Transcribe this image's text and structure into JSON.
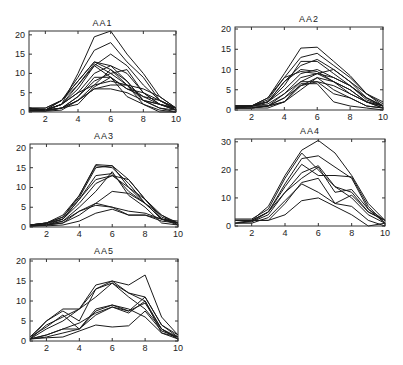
{
  "chart_data": [
    {
      "type": "line",
      "title": "AA1",
      "xlabel": "",
      "ylabel": "",
      "xlim": [
        1,
        10
      ],
      "ylim": [
        0,
        21
      ],
      "xticks": [
        2,
        4,
        6,
        8,
        10
      ],
      "yticks": [
        0,
        5,
        10,
        15,
        20
      ],
      "x": [
        1,
        2,
        3,
        4,
        5,
        6,
        7,
        8,
        9,
        10
      ],
      "series": [
        {
          "name": "s1",
          "values": [
            1,
            0.5,
            2,
            10,
            19.5,
            21,
            15,
            10,
            4,
            1
          ]
        },
        {
          "name": "s2",
          "values": [
            1,
            0.5,
            3,
            9,
            16,
            18,
            13,
            9,
            3,
            0.5
          ]
        },
        {
          "name": "s3",
          "values": [
            0.5,
            0.3,
            2,
            7,
            12,
            15,
            12,
            7,
            3,
            1
          ]
        },
        {
          "name": "s4",
          "values": [
            1,
            1,
            3,
            8,
            13,
            12,
            10,
            5,
            2,
            0.5
          ]
        },
        {
          "name": "s5",
          "values": [
            0.5,
            0.5,
            3,
            8,
            13,
            11,
            8,
            3,
            2,
            1
          ]
        },
        {
          "name": "s6",
          "values": [
            1,
            1,
            3,
            7,
            12.5,
            10,
            7,
            4,
            2,
            0.5
          ]
        },
        {
          "name": "s7",
          "values": [
            0.5,
            0.5,
            2,
            6,
            12,
            9,
            6,
            4,
            3,
            1
          ]
        },
        {
          "name": "s8",
          "values": [
            0.3,
            0.5,
            2,
            5,
            10,
            12,
            8,
            3,
            1,
            0
          ]
        },
        {
          "name": "s9",
          "values": [
            0.5,
            0.5,
            1,
            4,
            8,
            10,
            11,
            5,
            2,
            1
          ]
        },
        {
          "name": "s10",
          "values": [
            0.3,
            0.3,
            1,
            3,
            7,
            11,
            7,
            2,
            0,
            0
          ]
        },
        {
          "name": "s11",
          "values": [
            0.5,
            0.5,
            1,
            4,
            9,
            9,
            6,
            5,
            3,
            1
          ]
        },
        {
          "name": "s12",
          "values": [
            1,
            0.5,
            2,
            5,
            7,
            8,
            7,
            6,
            4,
            1
          ]
        },
        {
          "name": "s13",
          "values": [
            0.2,
            0.2,
            0.5,
            3,
            6,
            7,
            7,
            3,
            1,
            0.5
          ]
        },
        {
          "name": "s14",
          "values": [
            0.5,
            0.5,
            1,
            3,
            6,
            6,
            5,
            3,
            2,
            0.5
          ]
        },
        {
          "name": "s15",
          "values": [
            0.3,
            0.3,
            1,
            2,
            6.5,
            9,
            4,
            2,
            0.5,
            0
          ]
        }
      ]
    },
    {
      "type": "line",
      "title": "AA2",
      "xlabel": "",
      "ylabel": "",
      "xlim": [
        1,
        10
      ],
      "ylim": [
        0,
        20.5
      ],
      "xticks": [
        2,
        4,
        6,
        8,
        10
      ],
      "yticks": [
        0,
        5,
        10,
        15,
        20
      ],
      "x": [
        1,
        2,
        3,
        4,
        5,
        6,
        7,
        8,
        9,
        10
      ],
      "series": [
        {
          "name": "s1",
          "values": [
            1,
            1,
            3,
            9,
            15.3,
            15.5,
            12,
            8.5,
            4,
            1.5
          ]
        },
        {
          "name": "s2",
          "values": [
            1,
            1,
            2.5,
            8,
            13,
            14,
            11,
            8,
            4,
            1
          ]
        },
        {
          "name": "s3",
          "values": [
            1,
            1,
            2,
            7,
            11,
            12.5,
            10,
            7,
            3,
            1
          ]
        },
        {
          "name": "s4",
          "values": [
            0.5,
            1,
            2,
            6,
            12,
            12,
            9,
            6,
            2.5,
            1
          ]
        },
        {
          "name": "s5",
          "values": [
            0.5,
            1,
            2,
            7,
            10,
            9.5,
            7,
            4,
            2,
            0.5
          ]
        },
        {
          "name": "s6",
          "values": [
            1,
            1,
            3,
            8,
            9.5,
            9,
            7,
            5,
            2,
            1
          ]
        },
        {
          "name": "s7",
          "values": [
            0.5,
            1,
            2,
            5,
            9,
            10,
            8,
            6,
            3,
            1
          ]
        },
        {
          "name": "s8",
          "values": [
            0.5,
            0.5,
            1,
            4,
            8,
            9,
            10,
            7,
            4,
            2
          ]
        },
        {
          "name": "s9",
          "values": [
            1,
            1,
            1.5,
            4,
            7,
            9,
            8,
            6,
            3,
            1
          ]
        },
        {
          "name": "s10",
          "values": [
            0.5,
            0.5,
            1,
            3,
            6,
            8,
            7,
            5,
            2,
            0.5
          ]
        },
        {
          "name": "s11",
          "values": [
            0.5,
            0.5,
            1,
            2,
            6,
            7,
            6,
            4,
            2,
            1
          ]
        },
        {
          "name": "s12",
          "values": [
            0.5,
            1,
            1,
            3,
            7,
            7,
            4,
            3,
            1,
            0.5
          ]
        },
        {
          "name": "s13",
          "values": [
            1,
            1,
            1,
            2,
            5,
            8,
            5,
            3,
            1,
            0.5
          ]
        },
        {
          "name": "s14",
          "values": [
            0.5,
            0.5,
            0.5,
            2,
            6.5,
            6.5,
            2,
            1,
            0.5,
            0
          ]
        }
      ]
    },
    {
      "type": "line",
      "title": "AA3",
      "xlabel": "",
      "ylabel": "",
      "xlim": [
        1,
        10
      ],
      "ylim": [
        0,
        21
      ],
      "xticks": [
        2,
        4,
        6,
        8,
        10
      ],
      "yticks": [
        0,
        5,
        10,
        15,
        20
      ],
      "x": [
        1,
        2,
        3,
        4,
        5,
        6,
        7,
        8,
        9,
        10
      ],
      "series": [
        {
          "name": "s1",
          "values": [
            0.5,
            1,
            3,
            8,
            15.8,
            15.5,
            12,
            7,
            2,
            1
          ]
        },
        {
          "name": "s2",
          "values": [
            0.5,
            1,
            2.5,
            8,
            15.5,
            15,
            11,
            6,
            2,
            0.5
          ]
        },
        {
          "name": "s3",
          "values": [
            0.5,
            1,
            2.5,
            7.5,
            15,
            15.5,
            10,
            6,
            2,
            1
          ]
        },
        {
          "name": "s4",
          "values": [
            0.3,
            0.8,
            2,
            7,
            13,
            13.5,
            9,
            6,
            2,
            1
          ]
        },
        {
          "name": "s5",
          "values": [
            0.5,
            1,
            2,
            7,
            12,
            13,
            12,
            7,
            2.5,
            1
          ]
        },
        {
          "name": "s6",
          "values": [
            0.3,
            0.5,
            2,
            6,
            11,
            13,
            10,
            7,
            3,
            1
          ]
        },
        {
          "name": "s7",
          "values": [
            0.2,
            0.5,
            1.5,
            5,
            9,
            14,
            8,
            5,
            1,
            0.5
          ]
        },
        {
          "name": "s8",
          "values": [
            0.3,
            0.5,
            1,
            3,
            6,
            9,
            8.5,
            6,
            3,
            0.5
          ]
        },
        {
          "name": "s9",
          "values": [
            0.5,
            0.5,
            1,
            4,
            6,
            5,
            3,
            3,
            2,
            1
          ]
        },
        {
          "name": "s10",
          "values": [
            0.3,
            0.5,
            1.5,
            4,
            5.5,
            5,
            4,
            3.5,
            2,
            1.5
          ]
        },
        {
          "name": "s11",
          "values": [
            0.2,
            0.3,
            0.5,
            1.5,
            3.5,
            4.5,
            3,
            3,
            1.5,
            1
          ]
        }
      ]
    },
    {
      "type": "line",
      "title": "AA4",
      "xlabel": "",
      "ylabel": "",
      "xlim": [
        1,
        10
      ],
      "ylim": [
        0,
        31
      ],
      "xticks": [
        2,
        4,
        6,
        8,
        10
      ],
      "yticks": [
        0,
        10,
        20,
        30
      ],
      "x": [
        1,
        2,
        3,
        4,
        5,
        6,
        7,
        8,
        9,
        10
      ],
      "series": [
        {
          "name": "s1",
          "values": [
            2,
            2,
            7,
            18,
            27,
            30.5,
            26,
            18,
            8,
            2
          ]
        },
        {
          "name": "s2",
          "values": [
            2.5,
            2.5,
            6,
            17,
            26,
            20,
            14,
            10,
            4,
            1
          ]
        },
        {
          "name": "s3",
          "values": [
            2,
            2,
            5,
            15,
            24,
            25,
            21,
            17,
            6,
            2
          ]
        },
        {
          "name": "s4",
          "values": [
            1,
            2,
            5,
            14,
            22,
            18,
            18,
            17.5,
            7,
            1
          ]
        },
        {
          "name": "s5",
          "values": [
            2,
            1.5,
            5,
            12,
            19,
            21.5,
            14,
            12,
            5,
            2
          ]
        },
        {
          "name": "s6",
          "values": [
            1,
            1.5,
            4,
            12,
            17,
            21,
            12,
            13,
            6,
            1
          ]
        },
        {
          "name": "s7",
          "values": [
            2,
            2,
            2,
            8,
            15.5,
            17,
            8,
            11,
            5,
            2
          ]
        },
        {
          "name": "s8",
          "values": [
            1,
            1,
            3,
            9,
            15,
            12,
            8,
            7,
            2,
            0
          ]
        },
        {
          "name": "s9",
          "values": [
            2,
            2,
            2,
            4,
            9,
            10,
            7,
            4,
            0,
            1
          ]
        }
      ]
    },
    {
      "type": "line",
      "title": "AA5",
      "xlabel": "",
      "ylabel": "",
      "xlim": [
        1,
        10
      ],
      "ylim": [
        0,
        20.5
      ],
      "xticks": [
        2,
        4,
        6,
        8,
        10
      ],
      "yticks": [
        0,
        5,
        10,
        15,
        20
      ],
      "x": [
        1,
        2,
        3,
        4,
        5,
        6,
        7,
        8,
        9,
        10
      ],
      "series": [
        {
          "name": "s1",
          "values": [
            0.5,
            5,
            8,
            8,
            14,
            15,
            14,
            16.5,
            6,
            1.5
          ]
        },
        {
          "name": "s2",
          "values": [
            1,
            5,
            7.5,
            5,
            13,
            15,
            12,
            11,
            4,
            1
          ]
        },
        {
          "name": "s3",
          "values": [
            0.5,
            4,
            6,
            8,
            13,
            14.5,
            12,
            10,
            3,
            0.5
          ]
        },
        {
          "name": "s4",
          "values": [
            0.5,
            3,
            5,
            8,
            11,
            14.5,
            11,
            8,
            3,
            1
          ]
        },
        {
          "name": "s5",
          "values": [
            1,
            3.5,
            6.5,
            3,
            7.5,
            9,
            7.5,
            11,
            4,
            1.5
          ]
        },
        {
          "name": "s6",
          "values": [
            0.5,
            1.5,
            3,
            3,
            8,
            9,
            8,
            6,
            2,
            0.5
          ]
        },
        {
          "name": "s7",
          "values": [
            0.5,
            1.5,
            3,
            4.5,
            7,
            8.5,
            7,
            10,
            2,
            1
          ]
        },
        {
          "name": "s8",
          "values": [
            0.5,
            1,
            2,
            3,
            6.5,
            8.5,
            7.5,
            9.5,
            3,
            0.5
          ]
        },
        {
          "name": "s9",
          "values": [
            0.5,
            0.8,
            1,
            2.5,
            4,
            3.5,
            3.8,
            7.5,
            2.5,
            1
          ]
        }
      ]
    }
  ]
}
